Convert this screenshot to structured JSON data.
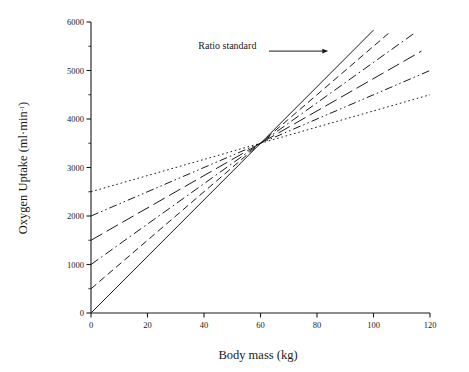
{
  "chart_data": {
    "type": "line",
    "title": "",
    "xlabel": "Body mass (kg)",
    "ylabel": "Oxygen Uptake (ml·min⁻¹)",
    "ylabel_main": "Oxygen Uptake (ml·min",
    "ylabel_sup": "-1",
    "ylabel_close": ")",
    "xlim": [
      0,
      120
    ],
    "ylim": [
      0,
      6000
    ],
    "xticks": [
      0,
      20,
      40,
      60,
      80,
      100,
      120
    ],
    "xtick_labels": [
      "0",
      "20",
      "40",
      "60",
      "80",
      "100",
      "120"
    ],
    "yticks": [
      0,
      1000,
      2000,
      3000,
      4000,
      5000,
      6000
    ],
    "ytick_labels": [
      "0",
      "1000",
      "2000",
      "3000",
      "4000",
      "5000",
      "6000"
    ],
    "yticks_minor": [
      500,
      1500,
      2500,
      3500,
      4500,
      5500
    ],
    "grid": false,
    "legend": "none",
    "convergence_point": {
      "x": 60,
      "y": 3500
    },
    "annotations": [
      {
        "label": "Ratio standard",
        "text_x": 38,
        "text_y": 5450,
        "arrow_from_x": 63,
        "arrow_from_y": 5400,
        "arrow_to_x": 84,
        "arrow_to_y": 5400
      }
    ],
    "series": [
      {
        "name": "Ratio standard (zero intercept)",
        "dash_style": "solid",
        "intercept": 0,
        "slope": 58.33,
        "x": [
          0,
          100
        ],
        "values": [
          0,
          5833
        ]
      },
      {
        "name": "Intercept 500",
        "dash_style": "dashed",
        "intercept": 500,
        "slope": 50.0,
        "x": [
          0,
          106
        ],
        "values": [
          500,
          5800
        ]
      },
      {
        "name": "Intercept 1000",
        "dash_style": "dash-dot",
        "intercept": 1000,
        "slope": 41.67,
        "x": [
          0,
          115
        ],
        "values": [
          1000,
          5792
        ]
      },
      {
        "name": "Intercept 1500",
        "dash_style": "long-dash",
        "intercept": 1500,
        "slope": 33.33,
        "x": [
          0,
          117
        ],
        "values": [
          1500,
          5400
        ]
      },
      {
        "name": "Intercept 2000",
        "dash_style": "dash-dot-dot",
        "intercept": 2000,
        "slope": 25.0,
        "x": [
          0,
          120
        ],
        "values": [
          2000,
          5000
        ]
      },
      {
        "name": "Intercept 2500",
        "dash_style": "dotted",
        "intercept": 2500,
        "slope": 16.67,
        "x": [
          0,
          120
        ],
        "values": [
          2500,
          4500
        ]
      }
    ]
  }
}
